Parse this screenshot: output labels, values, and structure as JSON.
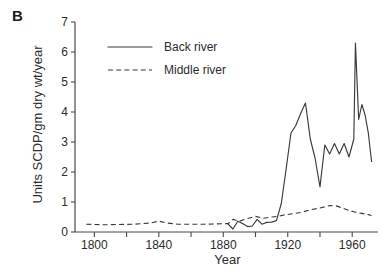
{
  "figure": {
    "panel_label": "B",
    "background_color": "#ffffff",
    "line_color": "#3a3a3a",
    "axis_color": "#4a4a4a"
  },
  "chart_data": {
    "type": "line",
    "title": "",
    "xlabel": "Year",
    "ylabel": "Units SCDP/gm dry wt/year",
    "xlim": [
      1788,
      1976
    ],
    "ylim": [
      0,
      7
    ],
    "yticks": [
      0,
      1,
      2,
      3,
      4,
      5,
      6,
      7
    ],
    "ytick_labels": [
      "0",
      "1",
      "2",
      "3",
      "4",
      "5",
      "6",
      "7"
    ],
    "xticks": [
      1800,
      1840,
      1880,
      1920,
      1960
    ],
    "xtick_labels": [
      "1800",
      "1840",
      "1880",
      "1920",
      "1960"
    ],
    "x_minor_ticks": [
      1820,
      1860,
      1900,
      1940
    ],
    "grid": false,
    "legend_position": "upper-left",
    "series": [
      {
        "name": "Back river",
        "style": "solid",
        "color": "#3a3a3a",
        "x": [
          1883,
          1886,
          1889,
          1892,
          1895,
          1898,
          1901,
          1904,
          1907,
          1910,
          1913,
          1916,
          1919,
          1922,
          1925,
          1928,
          1931,
          1934,
          1937,
          1940,
          1943,
          1946,
          1949,
          1952,
          1955,
          1958,
          1961,
          1962,
          1964,
          1966,
          1968,
          1970,
          1972
        ],
        "y": [
          0.26,
          0.1,
          0.36,
          0.28,
          0.18,
          0.2,
          0.42,
          0.26,
          0.32,
          0.33,
          0.38,
          0.95,
          2.1,
          3.3,
          3.55,
          3.95,
          4.3,
          3.1,
          2.45,
          1.5,
          2.9,
          2.6,
          2.95,
          2.6,
          2.95,
          2.5,
          3.1,
          6.3,
          3.75,
          4.25,
          3.9,
          3.3,
          2.35
        ]
      },
      {
        "name": "Middle river",
        "style": "dashed",
        "color": "#3a3a3a",
        "x": [
          1795,
          1805,
          1815,
          1825,
          1835,
          1840,
          1845,
          1852,
          1860,
          1868,
          1876,
          1883,
          1886,
          1890,
          1895,
          1900,
          1905,
          1910,
          1914,
          1918,
          1922,
          1928,
          1934,
          1940,
          1946,
          1950,
          1954,
          1958,
          1962,
          1966,
          1970,
          1972
        ],
        "y": [
          0.26,
          0.24,
          0.25,
          0.26,
          0.3,
          0.36,
          0.3,
          0.26,
          0.26,
          0.26,
          0.27,
          0.28,
          0.42,
          0.36,
          0.45,
          0.52,
          0.46,
          0.5,
          0.52,
          0.57,
          0.6,
          0.65,
          0.74,
          0.8,
          0.88,
          0.87,
          0.8,
          0.72,
          0.66,
          0.62,
          0.58,
          0.55
        ]
      }
    ],
    "legend": [
      {
        "label": "Back river",
        "style": "solid"
      },
      {
        "label": "Middle river",
        "style": "dashed"
      }
    ]
  }
}
